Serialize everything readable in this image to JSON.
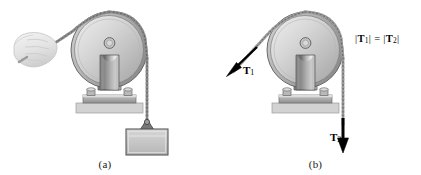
{
  "figure": {
    "background_color": "#ffffff",
    "panels": [
      {
        "id": "a",
        "caption": "(a)",
        "description": "Hand pulling a chain over a wall-mounted pulley supporting a hanging block",
        "elements": [
          "hand-gripping-chain",
          "pulley-wheel",
          "pulley-bracket",
          "mounting-plate",
          "base-slab",
          "chain",
          "hanging-block"
        ]
      },
      {
        "id": "b",
        "caption": "(b)",
        "description": "Free-body style diagram showing tension vectors T1 and T2 on the same pulley",
        "elements": [
          "pulley-wheel",
          "pulley-bracket",
          "mounting-plate",
          "base-slab",
          "chain",
          "tension-vector-t1",
          "tension-vector-t2",
          "tension-equality-equation"
        ]
      }
    ]
  },
  "labels": {
    "caption_a": "(a)",
    "caption_b": "(b)",
    "t1": {
      "symbol": "T",
      "subscript": "1"
    },
    "t2": {
      "symbol": "T",
      "subscript": "2"
    },
    "equation": {
      "full_text": "|T₁| = |T₂|",
      "left_bar": "|",
      "left_symbol": "T",
      "left_subscript": "1",
      "right_bar": "|",
      "equals": "=",
      "right_symbol": "T",
      "right_subscript": "2"
    }
  },
  "colors": {
    "outline": "#3a3a3a",
    "wheel_light": "#e8e8e8",
    "wheel_mid": "#c9c9c9",
    "wheel_dark": "#9a9a9a",
    "bracket_dark": "#6e6e6e",
    "bracket_light": "#e2e2e2",
    "plate": "#b4b4b4",
    "base_slab": "#d2d2d2",
    "block_fill": "#c8c8c8",
    "chain": "#8c8c8c",
    "arrow": "#000000",
    "hand": "#e4e4e4",
    "text": "#000000"
  }
}
